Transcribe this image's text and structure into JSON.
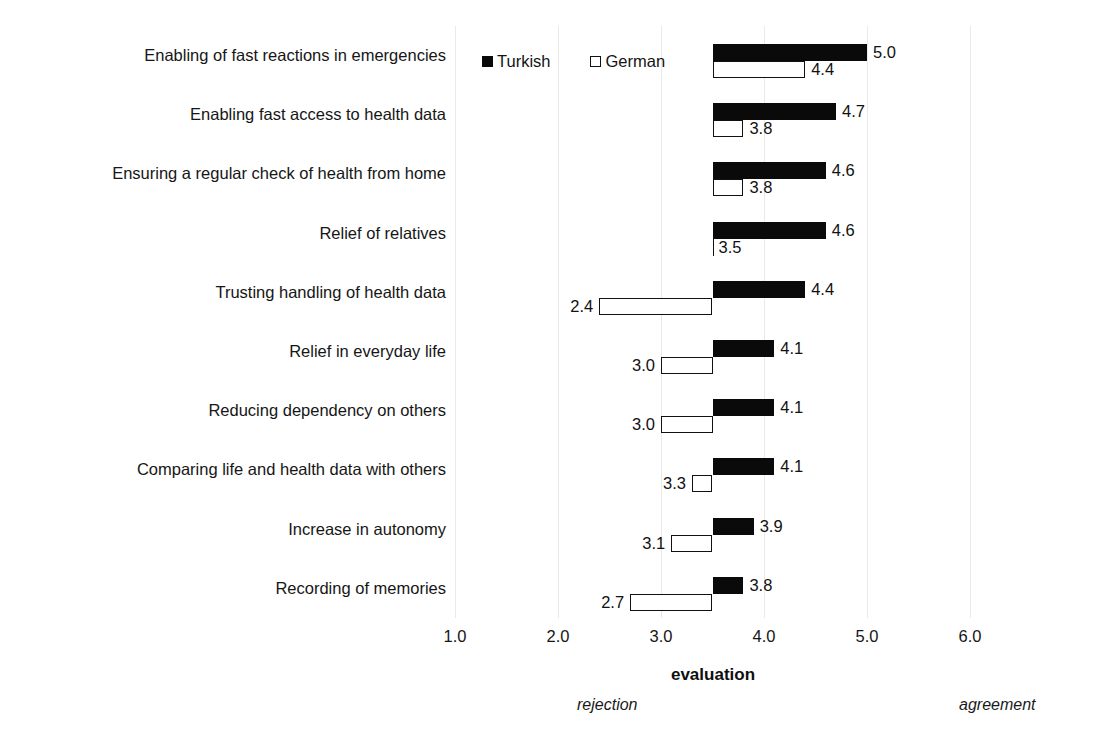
{
  "chart_data": {
    "type": "bar",
    "orientation": "horizontal",
    "title": "",
    "xlabel": "evaluation",
    "ylabel": "",
    "xlim": [
      1.0,
      6.0
    ],
    "baseline": 3.5,
    "grid": true,
    "legend_position": "top-center",
    "tick_labels": [
      "1.0",
      "2.0",
      "3.0",
      "4.0",
      "5.0",
      "6.0"
    ],
    "tick_values": [
      1.0,
      2.0,
      3.0,
      4.0,
      5.0,
      6.0
    ],
    "scale_anchors": {
      "low": "rejection",
      "high": "agreement"
    },
    "categories": [
      "Enabling of fast reactions in emergencies",
      "Enabling fast access to health data",
      "Ensuring a regular check of health from home",
      "Relief of relatives",
      "Trusting handling of health data",
      "Relief in everyday life",
      "Reducing dependency on others",
      "Comparing life and health data with others",
      "Increase in autonomy",
      "Recording of memories"
    ],
    "series": [
      {
        "name": "Turkish",
        "color": "#0a0a0a",
        "style": "filled",
        "values": [
          5.0,
          4.7,
          4.6,
          4.6,
          4.4,
          4.1,
          4.1,
          4.1,
          3.9,
          3.8
        ],
        "labels": [
          "5.0",
          "4.7",
          "4.6",
          "4.6",
          "4.4",
          "4.1",
          "4.1",
          "4.1",
          "3.9",
          "3.8"
        ]
      },
      {
        "name": "German",
        "color": "#ffffff",
        "style": "hollow",
        "values": [
          4.4,
          3.8,
          3.8,
          3.5,
          2.4,
          3.0,
          3.0,
          3.3,
          3.1,
          2.7
        ],
        "labels": [
          "4.4",
          "3.8",
          "3.8",
          "3.5",
          "2.4",
          "3.0",
          "3.0",
          "3.3",
          "3.1",
          "2.7"
        ]
      }
    ]
  },
  "legend": {
    "items": [
      {
        "label": "Turkish",
        "swatch": "filled-square-icon"
      },
      {
        "label": "German",
        "swatch": "hollow-square-icon"
      }
    ]
  },
  "axis": {
    "title": "evaluation",
    "rejection": "rejection",
    "agreement": "agreement"
  }
}
